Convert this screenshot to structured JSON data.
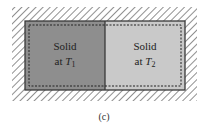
{
  "figure": {
    "left_block": {
      "line1": "Solid",
      "line2_prefix": "at ",
      "var": "T",
      "sub": "1",
      "color": "#8e8e8e"
    },
    "right_block": {
      "line1": "Solid",
      "line2_prefix": "at ",
      "var": "T",
      "sub": "2",
      "color": "#c9c9c9"
    },
    "caption": "(c)",
    "hatch_color": "#444444",
    "border_color": "#3a3a3a"
  }
}
